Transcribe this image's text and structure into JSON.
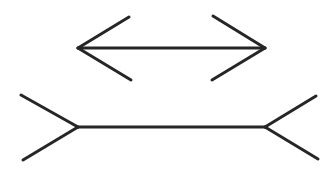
{
  "figure": {
    "name": "Müller-Lyer illusion",
    "stroke_color": "#262626",
    "background_color": "#ffffff",
    "figures": [
      {
        "id": "arrows-inward",
        "description": "Line with arrowheads pointing outward (fins inward)"
      },
      {
        "id": "fins-outward",
        "description": "Line with outward-spreading fins"
      }
    ]
  }
}
